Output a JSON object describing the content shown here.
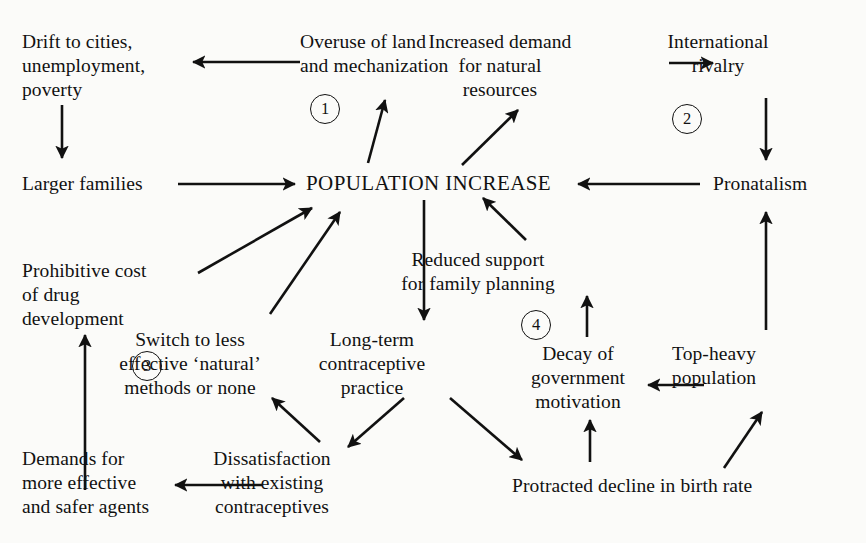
{
  "diagram": {
    "background_color": "#fbfbf9",
    "ink_color": "#111111",
    "nodes": [
      {
        "id": "drift",
        "label": "Drift to cities,\nunemployment,\npoverty",
        "x": 22,
        "y": 30,
        "align": "left"
      },
      {
        "id": "overuse",
        "label": "Overuse of land\nand mechanization",
        "x": 300,
        "y": 30,
        "align": "left"
      },
      {
        "id": "demand",
        "label": "Increased demand\nfor natural\nresources",
        "x": 500,
        "y": 30,
        "align": "center"
      },
      {
        "id": "rivalry",
        "label": "International\nrivalry",
        "x": 718,
        "y": 30,
        "align": "center"
      },
      {
        "id": "larger",
        "label": "Larger families",
        "x": 22,
        "y": 172,
        "align": "left"
      },
      {
        "id": "population",
        "label": "POPULATION INCREASE",
        "x": 306,
        "y": 171,
        "align": "left"
      },
      {
        "id": "pronatalism",
        "label": "Pronatalism",
        "x": 713,
        "y": 172,
        "align": "left"
      },
      {
        "id": "prohibitive",
        "label": "Prohibitive cost\nof drug\ndevelopment",
        "x": 22,
        "y": 259,
        "align": "left"
      },
      {
        "id": "reduced",
        "label": "Reduced support\nfor family planning",
        "x": 478,
        "y": 248,
        "align": "center"
      },
      {
        "id": "switch",
        "label": "Switch to less\neffective ‘natural’\nmethods or none",
        "x": 190,
        "y": 328,
        "align": "center"
      },
      {
        "id": "longterm",
        "label": "Long-term\ncontraceptive\npractice",
        "x": 372,
        "y": 328,
        "align": "center"
      },
      {
        "id": "decay",
        "label": "Decay of\ngovernment\nmotivation",
        "x": 578,
        "y": 342,
        "align": "center"
      },
      {
        "id": "topheavy",
        "label": "Top-heavy\npopulation",
        "x": 714,
        "y": 342,
        "align": "center"
      },
      {
        "id": "demands",
        "label": "Demands for\nmore effective\nand safer agents",
        "x": 22,
        "y": 447,
        "align": "left"
      },
      {
        "id": "dissatisfaction",
        "label": "Dissatisfaction\nwith existing\ncontraceptives",
        "x": 272,
        "y": 447,
        "align": "center"
      },
      {
        "id": "protracted",
        "label": "Protracted decline in birth rate",
        "x": 512,
        "y": 474,
        "align": "left"
      }
    ],
    "markers": [
      {
        "id": "marker-1",
        "label": "1",
        "x": 310,
        "y": 94
      },
      {
        "id": "marker-2",
        "label": "2",
        "x": 672,
        "y": 104
      },
      {
        "id": "marker-3",
        "label": "3",
        "x": 132,
        "y": 351
      },
      {
        "id": "marker-4",
        "label": "4",
        "x": 521,
        "y": 310
      }
    ],
    "edges": [
      {
        "id": "overuse-to-drift",
        "from": "overuse",
        "to": "drift",
        "x1": 300,
        "y1": 62,
        "x2": 193,
        "y2": 62
      },
      {
        "id": "demand-to-rivalry",
        "from": "demand",
        "to": "rivalry",
        "x1": 669,
        "y1": 63,
        "x2": 713,
        "y2": 63
      },
      {
        "id": "drift-to-larger",
        "from": "drift",
        "to": "larger",
        "x1": 62,
        "y1": 105,
        "x2": 62,
        "y2": 158
      },
      {
        "id": "rivalry-to-pronatalism",
        "from": "rivalry",
        "to": "pronatalism",
        "x1": 766,
        "y1": 98,
        "x2": 766,
        "y2": 160
      },
      {
        "id": "larger-to-population",
        "from": "larger",
        "to": "population",
        "x1": 178,
        "y1": 184,
        "x2": 295,
        "y2": 184
      },
      {
        "id": "pronatalism-to-population",
        "from": "pronatalism",
        "to": "population",
        "x1": 700,
        "y1": 184,
        "x2": 578,
        "y2": 184
      },
      {
        "id": "population-to-overuse",
        "from": "population",
        "to": "overuse",
        "x1": 368,
        "y1": 163,
        "x2": 385,
        "y2": 100
      },
      {
        "id": "population-to-demand",
        "from": "population",
        "to": "demand",
        "x1": 462,
        "y1": 165,
        "x2": 518,
        "y2": 110
      },
      {
        "id": "prohibitive-to-population",
        "from": "prohibitive",
        "to": "population",
        "x1": 198,
        "y1": 273,
        "x2": 312,
        "y2": 208
      },
      {
        "id": "switch-to-population",
        "from": "switch",
        "to": "population",
        "x1": 270,
        "y1": 314,
        "x2": 340,
        "y2": 212
      },
      {
        "id": "reduced-to-population",
        "from": "reduced",
        "to": "population",
        "x1": 526,
        "y1": 240,
        "x2": 483,
        "y2": 198
      },
      {
        "id": "population-to-longterm",
        "from": "population",
        "to": "longterm",
        "x1": 424,
        "y1": 200,
        "x2": 424,
        "y2": 320
      },
      {
        "id": "longterm-to-dissatisfaction",
        "from": "longterm",
        "to": "dissatisfaction",
        "x1": 404,
        "y1": 398,
        "x2": 348,
        "y2": 447
      },
      {
        "id": "longterm-to-protracted",
        "from": "longterm",
        "to": "protracted",
        "x1": 450,
        "y1": 398,
        "x2": 522,
        "y2": 460
      },
      {
        "id": "dissatisfaction-to-switch",
        "from": "dissatisfaction",
        "to": "switch",
        "x1": 320,
        "y1": 442,
        "x2": 272,
        "y2": 398
      },
      {
        "id": "dissatisfaction-to-demands",
        "from": "dissatisfaction",
        "to": "demands",
        "x1": 262,
        "y1": 485,
        "x2": 175,
        "y2": 485
      },
      {
        "id": "demands-to-prohibitive",
        "from": "demands",
        "to": "prohibitive",
        "x1": 85,
        "y1": 490,
        "x2": 85,
        "y2": 335
      },
      {
        "id": "protracted-to-decay",
        "from": "protracted",
        "to": "decay",
        "x1": 590,
        "y1": 462,
        "x2": 590,
        "y2": 420
      },
      {
        "id": "decay-to-reduced",
        "from": "decay",
        "to": "reduced",
        "x1": 587,
        "y1": 337,
        "x2": 587,
        "y2": 296
      },
      {
        "id": "topheavy-to-decay",
        "from": "topheavy",
        "to": "decay",
        "x1": 704,
        "y1": 385,
        "x2": 648,
        "y2": 385
      },
      {
        "id": "topheavy-to-pronatalism",
        "from": "topheavy",
        "to": "pronatalism",
        "x1": 766,
        "y1": 330,
        "x2": 766,
        "y2": 212
      },
      {
        "id": "protracted-to-topheavy",
        "from": "protracted",
        "to": "topheavy",
        "x1": 724,
        "y1": 468,
        "x2": 762,
        "y2": 412
      }
    ]
  }
}
